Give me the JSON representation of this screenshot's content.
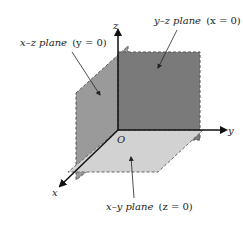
{
  "diagram": {
    "labels": {
      "yz_plane": {
        "name": "y–z plane",
        "condition": "(x = 0)"
      },
      "xz_plane": {
        "name": "x–z plane",
        "condition": "(y = 0)"
      },
      "xy_plane": {
        "name": "x–y plane",
        "condition": "(z = 0)"
      }
    },
    "axes": {
      "x": "x",
      "y": "y",
      "z": "z",
      "origin": "O"
    },
    "colors": {
      "yz_fill": "#7a7a7a",
      "xz_fill": "#9a9a9a",
      "xy_fill": "#cfcfcf",
      "edge": "#555555",
      "axis": "#111111"
    }
  }
}
